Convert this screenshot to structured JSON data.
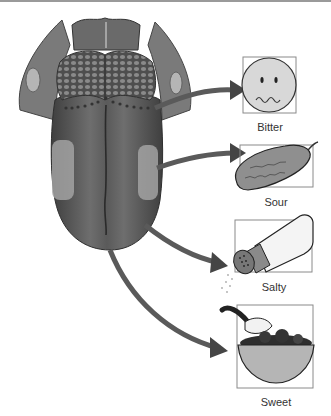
{
  "diagram": {
    "tastes": [
      {
        "label": "Bitter",
        "icon": "frowning-face-icon"
      },
      {
        "label": "Sour",
        "icon": "pickle-icon"
      },
      {
        "label": "Salty",
        "icon": "salt-shaker-icon"
      },
      {
        "label": "Sweet",
        "icon": "sugar-bowl-icon"
      }
    ]
  },
  "colors": {
    "tongue_dark": "#4a4a4a",
    "tongue_mid": "#6b6b6b",
    "tongue_light_patch": "#a8a8a8",
    "arrow": "#555555",
    "box_border": "#8a8a8a",
    "icon_fill": "#d8d8d8"
  }
}
